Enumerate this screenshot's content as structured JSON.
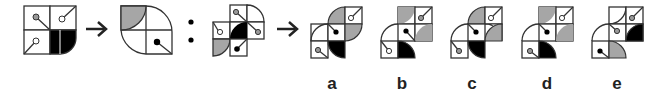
{
  "puzzle": {
    "type": "figure-analogy",
    "colors": {
      "line": "#333333",
      "gray": "#a6a6a6",
      "black": "#000000",
      "white": "#ffffff"
    },
    "separator": ":",
    "arrow": "→",
    "options": [
      {
        "label": "a",
        "x": 332
      },
      {
        "label": "b",
        "x": 402
      },
      {
        "label": "c",
        "x": 472
      },
      {
        "label": "d",
        "x": 547
      },
      {
        "label": "e",
        "x": 617
      }
    ]
  }
}
